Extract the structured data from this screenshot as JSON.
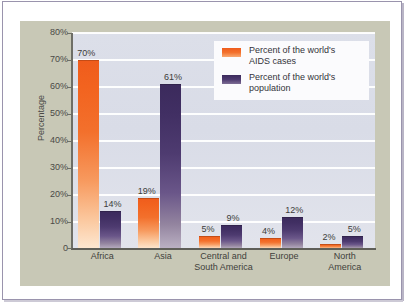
{
  "chart_data": {
    "type": "bar",
    "title": "",
    "xlabel": "",
    "ylabel": "Percentage",
    "ylim": [
      0,
      80
    ],
    "grid": true,
    "legend_position": "top-right",
    "categories": [
      "Africa",
      "Asia",
      "Central and South America",
      "Europe",
      "North America"
    ],
    "category_lines": [
      [
        "Africa"
      ],
      [
        "Asia"
      ],
      [
        "Central and",
        "South America"
      ],
      [
        "Europe"
      ],
      [
        "North",
        "America"
      ]
    ],
    "ytick_labels": [
      "80%",
      "70%",
      "60%",
      "50%",
      "40%",
      "30%",
      "20%",
      "10%",
      "0"
    ],
    "ytick_values": [
      80,
      70,
      60,
      50,
      40,
      30,
      20,
      10,
      0
    ],
    "series": [
      {
        "name": "Percent of the world's AIDS cases",
        "color": "#ef5c1c",
        "values": [
          70,
          19,
          5,
          4,
          2
        ],
        "value_labels": [
          "70%",
          "19%",
          "5%",
          "4%",
          "2%"
        ]
      },
      {
        "name": "Percent of the world's population",
        "color": "#3b2a5c",
        "values": [
          14,
          61,
          9,
          12,
          5
        ],
        "value_labels": [
          "14%",
          "61%",
          "9%",
          "12%",
          "5%"
        ]
      }
    ]
  },
  "legend": {
    "items": [
      {
        "label_line1": "Percent of the world's",
        "label_line2": "AIDS cases",
        "swatch": "aids"
      },
      {
        "label_line1": "Percent of the world's",
        "label_line2": "population",
        "swatch": "pop"
      }
    ]
  },
  "colors": {
    "aids_bar": "#ef5c1c",
    "population_bar": "#3b2a5c",
    "plot_background": "#dadde8",
    "card_background": "#c8c8b6",
    "gridline": "#ffffff",
    "axis": "#6e6e66",
    "frame_border": "#9a94ad"
  }
}
